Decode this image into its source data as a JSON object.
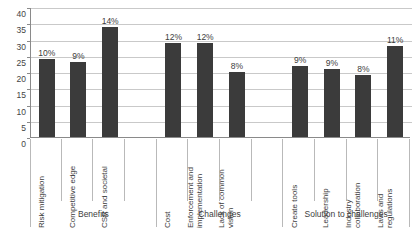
{
  "chart_data": {
    "type": "bar",
    "title": "",
    "subtitle": "",
    "xlabel": "",
    "ylabel": "",
    "ylim": [
      0,
      40
    ],
    "ytick_labels": [
      "40",
      "35",
      "30",
      "25",
      "20",
      "15",
      "10",
      "5",
      "0"
    ],
    "ytick_values": [
      40,
      35,
      30,
      25,
      20,
      15,
      10,
      5,
      0
    ],
    "grid": true,
    "legend": "none",
    "orientation": "vertical",
    "bar_color": "#3b3b3b",
    "gridline_color": "#c9c9c9",
    "axis_color": "#8a8a8a",
    "categories": [
      "Risk mitigation",
      "Competitive edge",
      "CSR and societal",
      "Cost",
      "Enforcement and implementation",
      "Lack of common vision",
      "Create tools",
      "Leadership",
      "Industry collaboration",
      "Laws and regulations"
    ],
    "values": [
      24,
      23,
      34,
      29,
      29,
      20,
      22,
      21,
      19,
      28
    ],
    "data_labels": [
      "10%",
      "9%",
      "14%",
      "12%",
      "12%",
      "8%",
      "9%",
      "9%",
      "8%",
      "11%"
    ],
    "groups": [
      {
        "label": "Benefits",
        "categories": [
          "Risk mitigation",
          "Competitive edge",
          "CSR and societal"
        ]
      },
      {
        "label": "Challenges",
        "categories": [
          "Cost",
          "Enforcement and implementation",
          "Lack of common vision"
        ]
      },
      {
        "label": "Solution to challenges",
        "categories": [
          "Create tools",
          "Leadership",
          "Industry collaboration",
          "Laws and regulations"
        ]
      }
    ]
  },
  "category_lines": [
    [
      "Risk mitigation"
    ],
    [
      "Competitive edge"
    ],
    [
      "CSR and societal"
    ],
    [
      "Cost"
    ],
    [
      "Enforcement and",
      "implementation"
    ],
    [
      "Lack of common",
      "vision"
    ],
    [
      "Create tools"
    ],
    [
      "Leadership"
    ],
    [
      "Industry",
      "collaboration"
    ],
    [
      "Laws and",
      "regulations"
    ]
  ]
}
